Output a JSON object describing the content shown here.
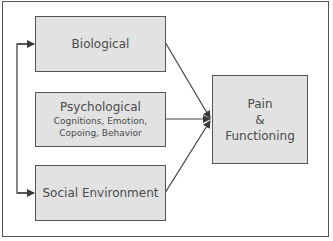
{
  "diagram": {
    "nodes": [
      {
        "id": "biological",
        "label": "Biological",
        "sublabel": ""
      },
      {
        "id": "psychological",
        "label": "Psychological",
        "sublabel_lines": [
          "Cognitions, Emotion,",
          "Copoing, Behavior"
        ]
      },
      {
        "id": "social",
        "label": "Social Environment",
        "sublabel": ""
      },
      {
        "id": "outcome",
        "label_lines": [
          "Pain",
          "&",
          "Functioning"
        ]
      }
    ],
    "edges": [
      {
        "from": "biological",
        "to": "outcome"
      },
      {
        "from": "psychological",
        "to": "outcome"
      },
      {
        "from": "social",
        "to": "outcome"
      },
      {
        "from": "social",
        "to": "biological",
        "bidirectional": true
      }
    ],
    "colors": {
      "box_fill": "#e2e2e2",
      "stroke": "#555555",
      "text": "#4a4a4a"
    }
  }
}
